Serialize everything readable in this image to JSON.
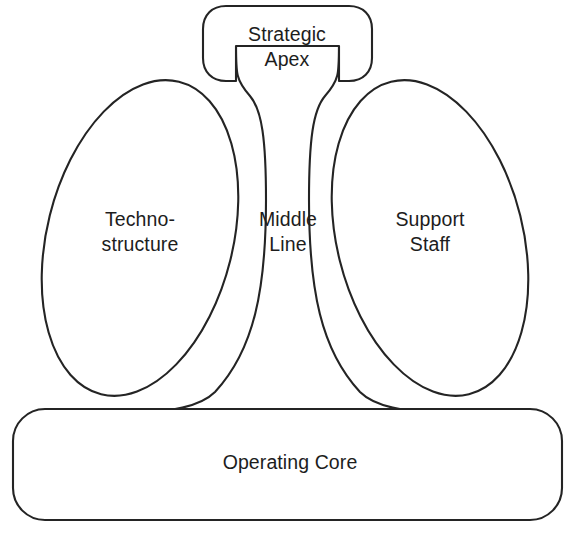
{
  "diagram": {
    "type": "organizational-structure-diagram",
    "background_color": "#ffffff",
    "stroke_color": "#242424",
    "text_color": "#1d1d1d",
    "parts": [
      {
        "id": "strategic-apex",
        "label": "Strategic\nApex",
        "shape": "rounded-rectangle",
        "position": "top-center"
      },
      {
        "id": "technostructure",
        "label": "Techno-\nstructure",
        "shape": "tilted-ellipse",
        "position": "left"
      },
      {
        "id": "middle-line",
        "label": "Middle\nLine",
        "shape": "tapered-column",
        "position": "center"
      },
      {
        "id": "support-staff",
        "label": "Support\nStaff",
        "shape": "tilted-ellipse",
        "position": "right"
      },
      {
        "id": "operating-core",
        "label": "Operating Core",
        "shape": "wide-rounded-rectangle",
        "position": "bottom"
      }
    ]
  }
}
